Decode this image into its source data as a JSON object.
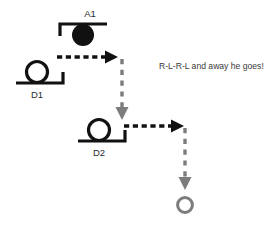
{
  "canvas": {
    "width": 279,
    "height": 226,
    "background": "#ffffff"
  },
  "colors": {
    "stroke_black": "#111111",
    "arrow_black": "#111111",
    "arrow_gray": "#7c7c7c",
    "label_text": "#2b2b2b",
    "caption_text": "#3a3a3a"
  },
  "nodes": [
    {
      "id": "A1",
      "label": "A1",
      "kind": "filled-circle-on-top-bracket",
      "filled": true,
      "label_position": "above"
    },
    {
      "id": "D1",
      "label": "D1",
      "kind": "open-circle-on-bottom-bracket",
      "filled": false,
      "label_position": "below"
    },
    {
      "id": "D2",
      "label": "D2",
      "kind": "open-circle-on-bottom-bracket",
      "filled": false,
      "label_position": "below"
    },
    {
      "id": "END",
      "label": "",
      "kind": "open-circle",
      "filled": false,
      "label_position": "none"
    }
  ],
  "connectors": [
    {
      "id": "a1-right",
      "from": "A1",
      "to": "turn-1",
      "direction": "right",
      "style": "dashed",
      "color": "#111111"
    },
    {
      "id": "turn1-down",
      "from": "turn-1",
      "to": "D2",
      "direction": "down",
      "style": "dashed",
      "color": "#7c7c7c"
    },
    {
      "id": "d2-right",
      "from": "D2",
      "to": "turn-2",
      "direction": "right",
      "style": "dashed",
      "color": "#111111"
    },
    {
      "id": "turn2-down",
      "from": "turn-2",
      "to": "END",
      "direction": "down",
      "style": "dashed",
      "color": "#7c7c7c"
    }
  ],
  "caption": {
    "text": "R-L-R-L and away he goes!"
  }
}
